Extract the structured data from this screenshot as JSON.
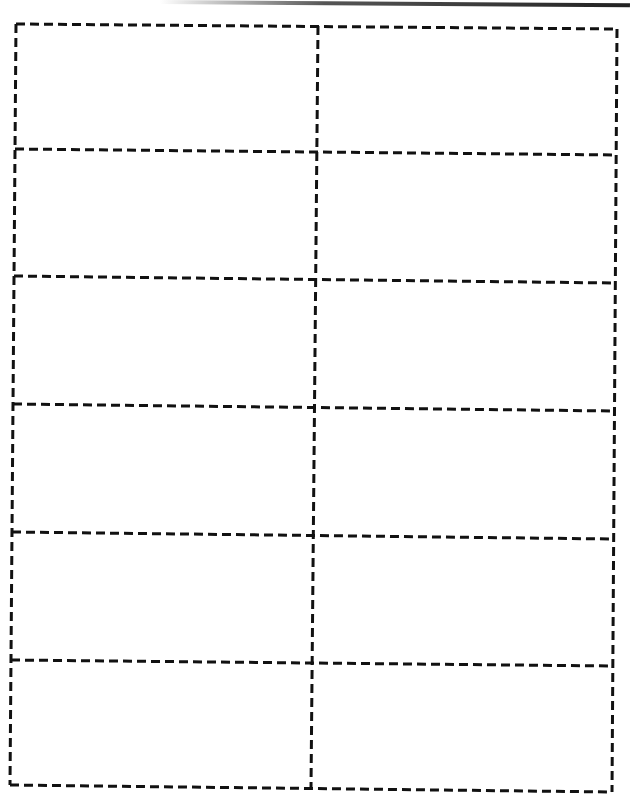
{
  "document": {
    "type": "label-sheet-template",
    "columns": 2,
    "rows": 6,
    "label_count": 12,
    "line_color": "#111111",
    "line_style": "dashed",
    "labels": [
      {
        "row": 1,
        "col": 1,
        "text": ""
      },
      {
        "row": 1,
        "col": 2,
        "text": ""
      },
      {
        "row": 2,
        "col": 1,
        "text": ""
      },
      {
        "row": 2,
        "col": 2,
        "text": ""
      },
      {
        "row": 3,
        "col": 1,
        "text": ""
      },
      {
        "row": 3,
        "col": 2,
        "text": ""
      },
      {
        "row": 4,
        "col": 1,
        "text": ""
      },
      {
        "row": 4,
        "col": 2,
        "text": ""
      },
      {
        "row": 5,
        "col": 1,
        "text": ""
      },
      {
        "row": 5,
        "col": 2,
        "text": ""
      },
      {
        "row": 6,
        "col": 1,
        "text": ""
      },
      {
        "row": 6,
        "col": 2,
        "text": ""
      }
    ]
  }
}
